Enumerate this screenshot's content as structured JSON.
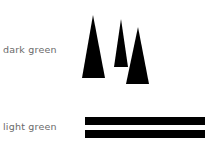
{
  "legend": {
    "items": [
      {
        "label": "dark green",
        "symbol": "tree-triangles",
        "color": "#000000"
      },
      {
        "label": "light green",
        "symbol": "double-bars",
        "color": "#000000"
      }
    ]
  }
}
